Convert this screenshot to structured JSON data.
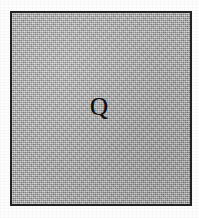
{
  "figure": {
    "kind": "bordered-square-region",
    "label": "Q",
    "border_color": "#232323",
    "fill_color": "#a8a8a8",
    "page_color": "#ffffff",
    "text_color": "#111111",
    "border_width_px": 2,
    "box_left_px": 10,
    "box_top_px": 11,
    "box_width_px": 182,
    "box_height_px": 195,
    "label_font_size_px": 25,
    "label_center_x_px": 98,
    "label_center_y_px": 108
  },
  "canvas": {
    "width_px": 199,
    "height_px": 218
  }
}
